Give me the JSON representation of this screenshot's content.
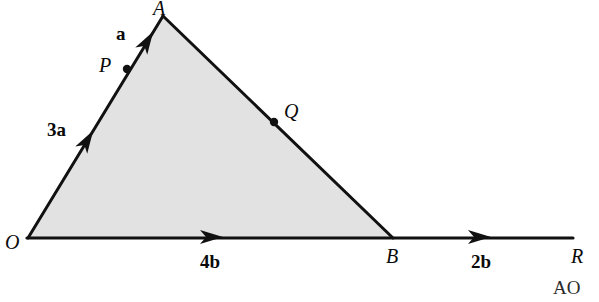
{
  "figure": {
    "background_color": "#ffffff",
    "stroke_color": "#111111",
    "fill_color": "#e2e2e2",
    "dot_color": "#111111"
  },
  "vertices": {
    "O": {
      "label": "O",
      "x": 28,
      "y": 238,
      "label_x": 5,
      "label_y": 232
    },
    "A": {
      "label": "A",
      "x": 163,
      "y": 16,
      "label_x": 153,
      "label_y": 0
    },
    "B": {
      "label": "B",
      "x": 393,
      "y": 238,
      "label_x": 386,
      "label_y": 246
    },
    "R": {
      "label": "R",
      "x": 573,
      "y": 238,
      "label_x": 571,
      "label_y": 246
    }
  },
  "points": {
    "P": {
      "label": "P",
      "x": 127,
      "y": 69,
      "label_x": 99,
      "label_y": 55
    },
    "Q": {
      "label": "Q",
      "x": 274,
      "y": 122,
      "label_x": 284,
      "label_y": 101
    }
  },
  "vector_labels": [
    {
      "name": "a",
      "text": "a",
      "x": 116,
      "y": 24
    },
    {
      "name": "3a",
      "text": "3a",
      "x": 47,
      "y": 120
    },
    {
      "name": "4b",
      "text": "4b",
      "x": 200,
      "y": 252
    },
    {
      "name": "2b",
      "text": "2b",
      "x": 471,
      "y": 252
    }
  ],
  "arrow_markers": [
    {
      "name": "arrow-oa-lower",
      "x": 88,
      "y": 139,
      "angle_deg": -58.7
    },
    {
      "name": "arrow-oa-upper",
      "x": 148,
      "y": 40,
      "angle_deg": -58.7
    },
    {
      "name": "arrow-ob-base",
      "x": 213,
      "y": 237,
      "angle_deg": 0
    },
    {
      "name": "arrow-br-base",
      "x": 481,
      "y": 237,
      "angle_deg": 0
    }
  ],
  "watermark": {
    "text": "AO",
    "x": 553,
    "y": 278
  }
}
